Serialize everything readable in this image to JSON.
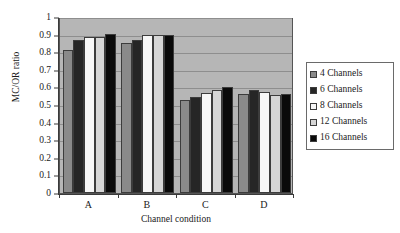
{
  "chart_data": {
    "type": "bar",
    "title": "",
    "xlabel": "Channel condition",
    "ylabel": "MC/OR ratio",
    "categories": [
      "A",
      "B",
      "C",
      "D"
    ],
    "ylim": [
      0,
      1
    ],
    "yticks": [
      "0",
      "0.1",
      "0.2",
      "0.3",
      "0.4",
      "0.5",
      "0.6",
      "0.7",
      "0.8",
      "0.9",
      "1"
    ],
    "grid": true,
    "legend_position": "right",
    "series": [
      {
        "name": "4 Channels",
        "color": "#8a8a8a",
        "values": [
          0.81,
          0.855,
          0.53,
          0.565
        ]
      },
      {
        "name": "6 Channels",
        "color": "#262626",
        "values": [
          0.87,
          0.87,
          0.545,
          0.585
        ]
      },
      {
        "name": "8 Channels",
        "color": "#f7f7f7",
        "values": [
          0.885,
          0.895,
          0.57,
          0.575
        ]
      },
      {
        "name": "12 Channels",
        "color": "#d6d6d6",
        "values": [
          0.885,
          0.9,
          0.585,
          0.555
        ]
      },
      {
        "name": "16 Channels",
        "color": "#0a0a0a",
        "values": [
          0.905,
          0.895,
          0.6,
          0.56
        ]
      }
    ]
  }
}
